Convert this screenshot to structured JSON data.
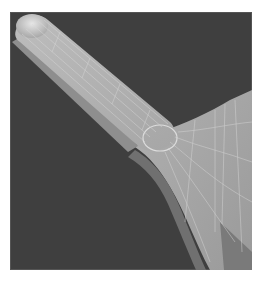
{
  "image": {
    "subject": "3D wireframe-shaded mesh of a rod/arm with rounded end joined by a fillet to a wider plate",
    "colors": {
      "background": "#3f3f3f",
      "surface_light": "#b4b4b4",
      "surface_mid": "#a2a2a2",
      "surface_dark": "#6e6e6e",
      "mesh_lines": "#d8d8d8",
      "page": "#ffffff"
    }
  }
}
